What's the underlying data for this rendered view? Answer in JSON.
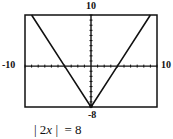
{
  "chart_data": {
    "type": "line",
    "title": "",
    "caption": "| 2x |  = 8",
    "series": [
      {
        "name": "y = |2x| - 8",
        "x": [
          -9,
          -4,
          0,
          4,
          9
        ],
        "y": [
          10,
          0,
          -8,
          0,
          10
        ]
      }
    ],
    "xlabel": "",
    "ylabel": "",
    "xlim": [
      -10,
      10
    ],
    "ylim": [
      -8,
      10
    ],
    "x_tick_step": 1,
    "y_tick_step": 1,
    "window_labels": {
      "xmin": "-10",
      "xmax": "10",
      "ymin": "-8",
      "ymax": "10"
    },
    "grid": false,
    "legend": "none"
  },
  "labels": {
    "ymax": "10",
    "xmin": "-10",
    "xmax": "10",
    "ymin": "-8"
  },
  "caption": {
    "left_bar": "| ",
    "coef": "2",
    "var": "x",
    "right": " |  = 8"
  }
}
